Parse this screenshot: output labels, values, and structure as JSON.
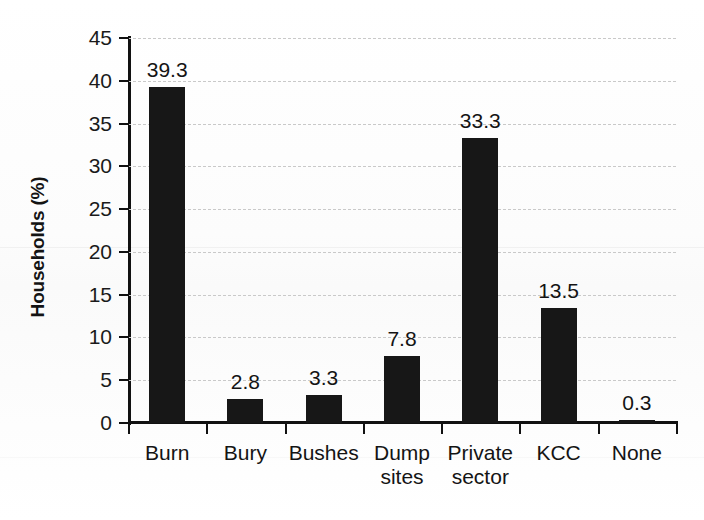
{
  "chart_data": {
    "type": "bar",
    "title": "",
    "xlabel": "",
    "ylabel": "Households (%)",
    "categories": [
      "Burn",
      "Bury",
      "Bushes",
      "Dump sites",
      "Private sector",
      "KCC",
      "None"
    ],
    "category_lines": [
      [
        "Burn"
      ],
      [
        "Bury"
      ],
      [
        "Bushes"
      ],
      [
        "Dump",
        "sites"
      ],
      [
        "Private",
        "sector"
      ],
      [
        "KCC"
      ],
      [
        "None"
      ]
    ],
    "values": [
      39.3,
      2.8,
      3.3,
      7.8,
      33.3,
      13.5,
      0.3
    ],
    "value_labels": [
      "39.3",
      "2.8",
      "3.3",
      "7.8",
      "33.3",
      "13.5",
      "0.3"
    ],
    "ylim": [
      0,
      45
    ],
    "ytick_step": 5,
    "ytick_labels": [
      "45",
      "40",
      "35",
      "30",
      "25",
      "20",
      "15",
      "10",
      "5",
      "0"
    ],
    "ytick_values": [
      45,
      40,
      35,
      30,
      25,
      20,
      15,
      10,
      5,
      0
    ],
    "grid": true,
    "grid_axis": "y",
    "grid_style": "dashed",
    "legend": "none",
    "bar_color": "#171717",
    "grid_color": "#c9c9c9",
    "axis_color": "#111111",
    "background_color": "#fdfdfd"
  }
}
